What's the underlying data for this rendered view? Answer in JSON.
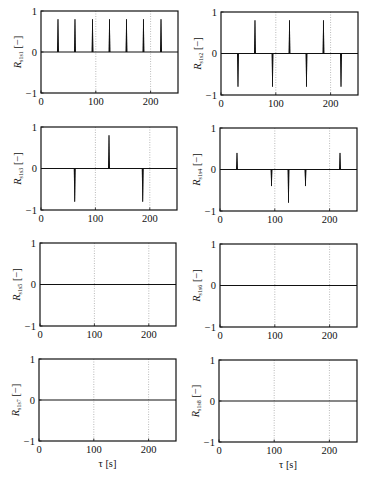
{
  "figure": {
    "x_axis_label": "τ [s]",
    "y_unit": "[−]",
    "x_ticks": [
      "0",
      "100",
      "200"
    ],
    "y_ticks": [
      "1",
      "0",
      "−1"
    ]
  },
  "chart_data": [
    {
      "type": "bar",
      "title": "",
      "ylabel_main": "R",
      "ylabel_sub": "s1s1",
      "ylabel": "R_s1s1 [−]",
      "xlabel": "",
      "xlim": [
        0,
        250
      ],
      "ylim": [
        -1,
        1
      ],
      "grid": "vertical dotted at 100, 200",
      "spikes": [
        {
          "x": 31,
          "y": 0.8
        },
        {
          "x": 62,
          "y": 0.8
        },
        {
          "x": 94,
          "y": 0.8
        },
        {
          "x": 125,
          "y": 0.8
        },
        {
          "x": 156,
          "y": 0.8
        },
        {
          "x": 187,
          "y": 0.8
        },
        {
          "x": 219,
          "y": 0.8
        }
      ]
    },
    {
      "type": "bar",
      "title": "",
      "ylabel_main": "R",
      "ylabel_sub": "s1s2",
      "ylabel": "R_s1s2 [−]",
      "xlabel": "",
      "xlim": [
        0,
        250
      ],
      "ylim": [
        -1,
        1
      ],
      "grid": "vertical dotted at 100, 200",
      "spikes": [
        {
          "x": 31,
          "y": -0.8
        },
        {
          "x": 62,
          "y": 0.8
        },
        {
          "x": 94,
          "y": -0.8
        },
        {
          "x": 125,
          "y": 0.8
        },
        {
          "x": 156,
          "y": -0.8
        },
        {
          "x": 187,
          "y": 0.8
        },
        {
          "x": 219,
          "y": -0.8
        }
      ]
    },
    {
      "type": "bar",
      "title": "",
      "ylabel_main": "R",
      "ylabel_sub": "s1s3",
      "ylabel": "R_s1s3 [−]",
      "xlabel": "",
      "xlim": [
        0,
        250
      ],
      "ylim": [
        -1,
        1
      ],
      "grid": "vertical dotted at 100, 200",
      "spikes": [
        {
          "x": 62,
          "y": -0.8
        },
        {
          "x": 125,
          "y": 0.8
        },
        {
          "x": 187,
          "y": -0.8
        }
      ]
    },
    {
      "type": "bar",
      "title": "",
      "ylabel_main": "R",
      "ylabel_sub": "s1s4",
      "ylabel": "R_s1s4 [−]",
      "xlabel": "",
      "xlim": [
        0,
        250
      ],
      "ylim": [
        -1,
        1
      ],
      "grid": "vertical dotted at 100, 200",
      "spikes": [
        {
          "x": 31,
          "y": 0.4
        },
        {
          "x": 94,
          "y": -0.4
        },
        {
          "x": 125,
          "y": -0.8
        },
        {
          "x": 156,
          "y": -0.4
        },
        {
          "x": 219,
          "y": 0.4
        }
      ]
    },
    {
      "type": "line",
      "title": "",
      "ylabel_main": "R",
      "ylabel_sub": "s1s5",
      "ylabel": "R_s1s5 [−]",
      "xlabel": "",
      "xlim": [
        0,
        250
      ],
      "ylim": [
        -1,
        1
      ],
      "grid": "vertical dotted at 100, 200",
      "spikes": [],
      "note": "flat at 0"
    },
    {
      "type": "line",
      "title": "",
      "ylabel_main": "R",
      "ylabel_sub": "s1s6",
      "ylabel": "R_s1s6 [−]",
      "xlabel": "",
      "xlim": [
        0,
        250
      ],
      "ylim": [
        -1,
        1
      ],
      "grid": "vertical dotted at 100, 200",
      "spikes": [],
      "note": "flat at 0"
    },
    {
      "type": "line",
      "title": "",
      "ylabel_main": "R",
      "ylabel_sub": "s1s7",
      "ylabel": "R_s1s7 [−]",
      "xlabel": "τ [s]",
      "xlim": [
        0,
        250
      ],
      "ylim": [
        -1,
        1
      ],
      "grid": "vertical dotted at 100, 200",
      "spikes": [],
      "note": "flat at 0"
    },
    {
      "type": "line",
      "title": "",
      "ylabel_main": "R",
      "ylabel_sub": "s1s8",
      "ylabel": "R_s1s8 [−]",
      "xlabel": "τ [s]",
      "xlim": [
        0,
        250
      ],
      "ylim": [
        -1,
        1
      ],
      "grid": "vertical dotted at 100, 200",
      "spikes": [],
      "note": "flat at 0"
    }
  ]
}
